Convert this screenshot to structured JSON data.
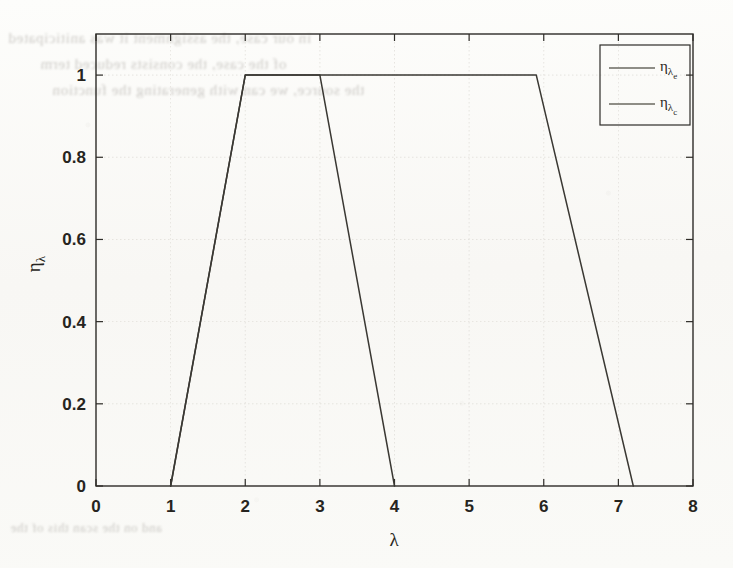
{
  "figure": {
    "background_color": "#fbfbf9",
    "ink_color": "#3a3833",
    "axis_color": "#2e2c28",
    "grid_color": "#d8d6d0"
  },
  "showthrough_text": {
    "line1": "in our case, the assignment it was aniticipated",
    "line2": "of the case, the consists reduced term",
    "line3": "the source, we can with generating the function",
    "line4": "and on the scan this of the"
  },
  "chart_data": {
    "type": "line",
    "title": "",
    "xlabel": "λ",
    "ylabel": "η_λ",
    "xlim": [
      0,
      8
    ],
    "ylim": [
      0,
      1.1
    ],
    "xticks": [
      0,
      1,
      2,
      3,
      4,
      5,
      6,
      7,
      8
    ],
    "xtick_labels": [
      "0",
      "1",
      "2",
      "3",
      "4",
      "5",
      "6",
      "7",
      "8"
    ],
    "yticks": [
      0,
      0.2,
      0.4,
      0.6,
      0.8,
      1
    ],
    "ytick_labels": [
      "0",
      "0.2",
      "0.4",
      "0.6",
      "0.8",
      "1"
    ],
    "grid": true,
    "legend_position": "upper right",
    "series": [
      {
        "name": "ηλe",
        "label_base": "η",
        "label_sub": "λ",
        "label_sub2": "e",
        "color": "#3a3833",
        "x": [
          1,
          2,
          5.9,
          7.2
        ],
        "y": [
          0,
          1,
          1,
          0
        ],
        "description": "trapezoid rising 1→2, plateau 2→5.9, falling 5.9→7.2"
      },
      {
        "name": "ηλc",
        "label_base": "η",
        "label_sub": "λ",
        "label_sub2": "c",
        "color": "#3a3833",
        "x": [
          1,
          2,
          3,
          4
        ],
        "y": [
          0,
          1,
          1,
          0
        ],
        "description": "trapezoid rising 1→2, plateau 2→3, falling 3→4"
      }
    ]
  }
}
